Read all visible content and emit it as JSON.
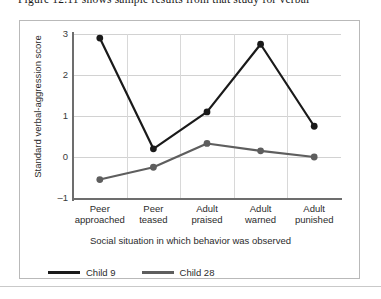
{
  "page": {
    "top_text": "Figure 12.11 shows sample results from that study for verbal"
  },
  "chart_data": {
    "type": "line",
    "title": "",
    "xlabel": "Social situation in which behavior was observed",
    "ylabel": "Standard verbal-aggression score",
    "categories": [
      "Peer\napproached",
      "Peer\nteased",
      "Adult\npraised",
      "Adult\nwarned",
      "Adult\npunished"
    ],
    "category_lines": [
      [
        "Peer",
        "approached"
      ],
      [
        "Peer",
        "teased"
      ],
      [
        "Adult",
        "praised"
      ],
      [
        "Adult",
        "warned"
      ],
      [
        "Adult",
        "punished"
      ]
    ],
    "ylim": [
      -1,
      3
    ],
    "yticks": [
      3,
      2,
      1,
      0,
      -1
    ],
    "ytick_labels": [
      "3",
      "2",
      "1",
      "0",
      "–1"
    ],
    "grid": true,
    "legend_position": "below",
    "series": [
      {
        "name": "Child 9",
        "color": "#1a1a1a",
        "values": [
          2.9,
          0.2,
          1.1,
          2.75,
          0.75
        ]
      },
      {
        "name": "Child 28",
        "color": "#5e5e5e",
        "values": [
          -0.55,
          -0.25,
          0.33,
          0.15,
          0.0
        ]
      }
    ]
  }
}
